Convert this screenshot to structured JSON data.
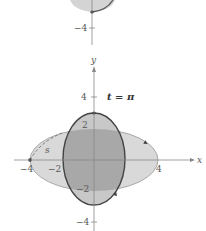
{
  "top_panel": {
    "tick_neg4": "−4"
  },
  "main_panel": {
    "title": "t = π",
    "axis_labels": {
      "x": "x",
      "y": "y"
    },
    "ticks": {
      "y_pos4": "4",
      "y_pos2": "2",
      "y_neg2": "−2",
      "y_neg4": "−4",
      "x_neg4": "−4",
      "x_neg2": "−2",
      "x_pos4": "4"
    },
    "arc_label": "s"
  },
  "colors": {
    "axis": "#888888",
    "curve": "#555555",
    "light_fill": "#d9d9d9",
    "mid_fill": "#c4c4c4",
    "overlap_fill": "#a6a6a6"
  }
}
